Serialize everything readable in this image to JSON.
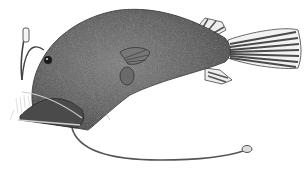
{
  "image": {
    "subject": "Anglerfish illustration",
    "style": "black-and-white stipple engraving",
    "background": "#ffffff",
    "colors": {
      "body_dark": "#3a3a3a",
      "body_mid": "#6b6b6b",
      "body_light": "#9a9a9a",
      "fin_light": "#e8e8e8",
      "outline": "#2a2a2a"
    },
    "elements": [
      "illicium-lure",
      "eye",
      "open-jaw-with-teeth",
      "pectoral-fin",
      "dorsal-fin",
      "anal-fin",
      "caudal-fin",
      "trailing-barbel-filament"
    ]
  }
}
